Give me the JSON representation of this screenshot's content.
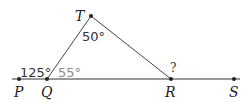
{
  "diagram": {
    "type": "geometry-triangle",
    "points": {
      "P": {
        "label": "P"
      },
      "Q": {
        "label": "Q"
      },
      "R": {
        "label": "R"
      },
      "S": {
        "label": "S"
      },
      "T": {
        "label": "T"
      }
    },
    "angles": {
      "PQT": "125°",
      "TQR": "55°",
      "QTR": "50°",
      "TRS": "?"
    },
    "colors": {
      "line": "#333333",
      "label": "#222222",
      "angle_gray": "#8a8a8a"
    }
  }
}
